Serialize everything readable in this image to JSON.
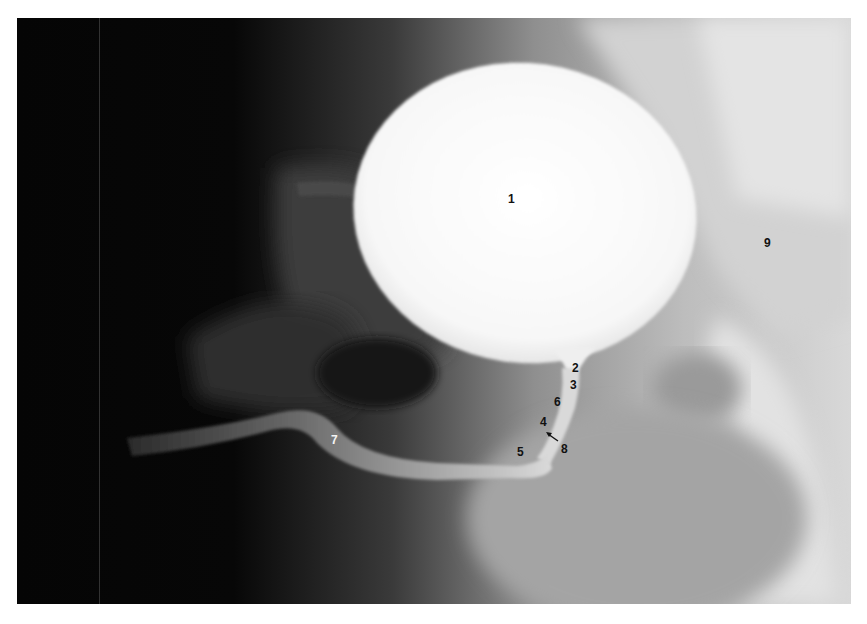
{
  "image": {
    "type": "radiograph",
    "description": "Contrast-filled bladder with urethra, pelvic bones",
    "colors": {
      "background": "#ffffff",
      "film_dark": "#050505",
      "contrast_bright": "#fbfbfb",
      "soft_tissue": "#bdbdbd",
      "label_dark": "#111111",
      "label_light": "#f4f4f4"
    }
  },
  "labels": [
    {
      "id": "1",
      "text": "1",
      "x": 508,
      "y": 193,
      "tone": "dark"
    },
    {
      "id": "2",
      "text": "2",
      "x": 572,
      "y": 362,
      "tone": "dark"
    },
    {
      "id": "3",
      "text": "3",
      "x": 570,
      "y": 379,
      "tone": "dark"
    },
    {
      "id": "6",
      "text": "6",
      "x": 554,
      "y": 396,
      "tone": "dark"
    },
    {
      "id": "4",
      "text": "4",
      "x": 540,
      "y": 416,
      "tone": "dark"
    },
    {
      "id": "8",
      "text": "8",
      "x": 561,
      "y": 443,
      "tone": "dark"
    },
    {
      "id": "5",
      "text": "5",
      "x": 517,
      "y": 446,
      "tone": "dark"
    },
    {
      "id": "7",
      "text": "7",
      "x": 331,
      "y": 434,
      "tone": "light"
    },
    {
      "id": "9",
      "text": "9",
      "x": 764,
      "y": 237,
      "tone": "dark"
    }
  ],
  "arrow": {
    "label": "8",
    "from": [
      558,
      440
    ],
    "to": [
      546,
      433
    ]
  }
}
